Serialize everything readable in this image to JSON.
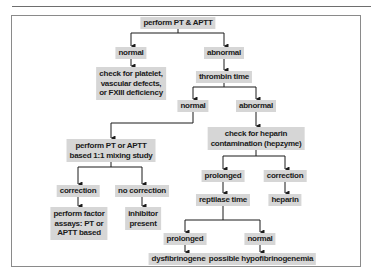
{
  "flowchart": {
    "nodes": {
      "start": "perform PT & APTT",
      "pt_normal": "normal",
      "pt_abnormal": "abnormal",
      "check_platelet": [
        "check for platelet,",
        "vascular defects,",
        "or FXIII deficiency"
      ],
      "thrombin_time": "thrombin time",
      "tt_normal": "normal",
      "tt_abnormal": "abnormal",
      "mixing_study": [
        "perform PT or APTT",
        "based 1:1 mixing study"
      ],
      "heparin_check": [
        "check for heparin",
        "contamination (hepzyme)"
      ],
      "mix_correction": "correction",
      "mix_no_correction": "no correction",
      "factor_assays": [
        "perform factor",
        "assays: PT or",
        "APTT based"
      ],
      "inhibitor": [
        "inhibitor",
        "present"
      ],
      "hep_prolonged": "prolonged",
      "hep_correction": "correction",
      "reptilase": "reptilase time",
      "heparin": "heparin",
      "rep_prolonged": "prolonged",
      "rep_normal": "normal",
      "dysfibrinogenemia": "dysfibrinogenemia",
      "hypofibrinogenemia": "possible hypofibrinogenemia"
    },
    "colors": {
      "node_fill": "#d6d6d6",
      "line": "#1a1a1a",
      "frame": "#8a8a8a"
    }
  }
}
